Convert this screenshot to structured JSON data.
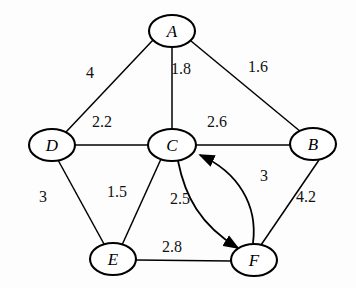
{
  "diagram": {
    "type": "weighted-graph",
    "title": "",
    "nodes": [
      {
        "id": "A",
        "label": "A",
        "x": 172,
        "y": 31,
        "rx": 23,
        "ry": 16
      },
      {
        "id": "B",
        "label": "B",
        "x": 313,
        "y": 144,
        "rx": 23,
        "ry": 16
      },
      {
        "id": "C",
        "label": "C",
        "x": 172,
        "y": 145,
        "rx": 24,
        "ry": 16
      },
      {
        "id": "D",
        "label": "D",
        "x": 52,
        "y": 145,
        "rx": 23,
        "ry": 16
      },
      {
        "id": "E",
        "label": "E",
        "x": 113,
        "y": 259,
        "rx": 23,
        "ry": 16
      },
      {
        "id": "F",
        "label": "F",
        "x": 254,
        "y": 260,
        "rx": 23,
        "ry": 16
      }
    ],
    "edges": [
      {
        "from": "A",
        "to": "D",
        "weight": "4",
        "label_x": 90,
        "label_y": 72,
        "directed": false,
        "style": "straight"
      },
      {
        "from": "A",
        "to": "C",
        "weight": "1.8",
        "label_x": 181,
        "label_y": 68,
        "directed": false,
        "style": "straight"
      },
      {
        "from": "A",
        "to": "B",
        "weight": "1.6",
        "label_x": 258,
        "label_y": 66,
        "directed": false,
        "style": "straight"
      },
      {
        "from": "D",
        "to": "C",
        "weight": "2.2",
        "label_x": 102,
        "label_y": 121,
        "directed": false,
        "style": "straight"
      },
      {
        "from": "C",
        "to": "B",
        "weight": "2.6",
        "label_x": 217,
        "label_y": 121,
        "directed": false,
        "style": "straight"
      },
      {
        "from": "D",
        "to": "E",
        "weight": "3",
        "label_x": 43,
        "label_y": 196,
        "directed": false,
        "style": "straight"
      },
      {
        "from": "E",
        "to": "C",
        "weight": "1.5",
        "label_x": 117,
        "label_y": 191,
        "directed": false,
        "style": "straight"
      },
      {
        "from": "C",
        "to": "F",
        "weight": "2.5",
        "label_x": 180,
        "label_y": 198,
        "directed": true,
        "style": "curve-outward"
      },
      {
        "from": "F",
        "to": "C",
        "weight": "3",
        "label_x": 264,
        "label_y": 175,
        "directed": true,
        "style": "curve-inward"
      },
      {
        "from": "B",
        "to": "F",
        "weight": "4.2",
        "label_x": 306,
        "label_y": 196,
        "directed": false,
        "style": "straight"
      },
      {
        "from": "E",
        "to": "F",
        "weight": "2.8",
        "label_x": 172,
        "label_y": 246,
        "directed": false,
        "style": "straight"
      }
    ],
    "colors": {
      "node_fill": "#ffffff",
      "stroke": "#000000",
      "background": "#fdfdfd",
      "label_text": "#111111"
    }
  }
}
